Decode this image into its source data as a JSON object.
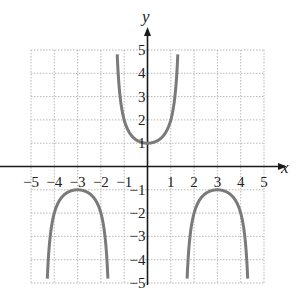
{
  "chart_data": {
    "type": "line",
    "title": "",
    "function": "y = sec(pi*x/3)",
    "xlabel": "x",
    "ylabel": "y",
    "xlim": [
      -5,
      5
    ],
    "ylim": [
      -5,
      5
    ],
    "grid": true,
    "grid_style": "dotted",
    "x_ticks": [
      -5,
      -4,
      -3,
      -2,
      -1,
      1,
      2,
      3,
      4,
      5
    ],
    "x_tick_labels": [
      "−5",
      "−4",
      "−3",
      "−2",
      "−1",
      "1",
      "2",
      "3",
      "4",
      "5"
    ],
    "y_ticks": [
      5,
      4,
      3,
      2,
      1,
      -1,
      -2,
      -3,
      -4,
      -5
    ],
    "y_tick_labels": [
      "5",
      "4",
      "3",
      "2",
      "1",
      "−1",
      "−2",
      "−3",
      "−4",
      "−5"
    ],
    "vertical_asymptotes": [
      -4.5,
      -1.5,
      1.5,
      4.5
    ],
    "series": [
      {
        "name": "upper branch",
        "x": [
          -1.31,
          -1.2,
          -1.0,
          -0.8,
          -0.5,
          0,
          0.5,
          0.8,
          1.0,
          1.2,
          1.31
        ],
        "values": [
          5.0,
          3.24,
          2.0,
          1.5,
          1.15,
          1.0,
          1.15,
          1.5,
          2.0,
          3.24,
          5.0
        ]
      },
      {
        "name": "lower-left branch",
        "x": [
          -4.31,
          -4.2,
          -4.0,
          -3.5,
          -3.0,
          -2.5,
          -2.0,
          -1.8,
          -1.69
        ],
        "values": [
          -5.0,
          -3.24,
          -2.0,
          -1.15,
          -1.0,
          -1.15,
          -2.0,
          -3.24,
          -5.0
        ]
      },
      {
        "name": "lower-right branch",
        "x": [
          1.69,
          1.8,
          2.0,
          2.5,
          3.0,
          3.5,
          4.0,
          4.2,
          4.31
        ],
        "values": [
          -5.0,
          -3.24,
          -2.0,
          -1.15,
          -1.0,
          -1.15,
          -2.0,
          -3.24,
          -5.0
        ]
      }
    ],
    "colors": {
      "curve": "#7a7a7a",
      "axis": "#1a1a1a",
      "grid": "#b8b8b8"
    }
  }
}
